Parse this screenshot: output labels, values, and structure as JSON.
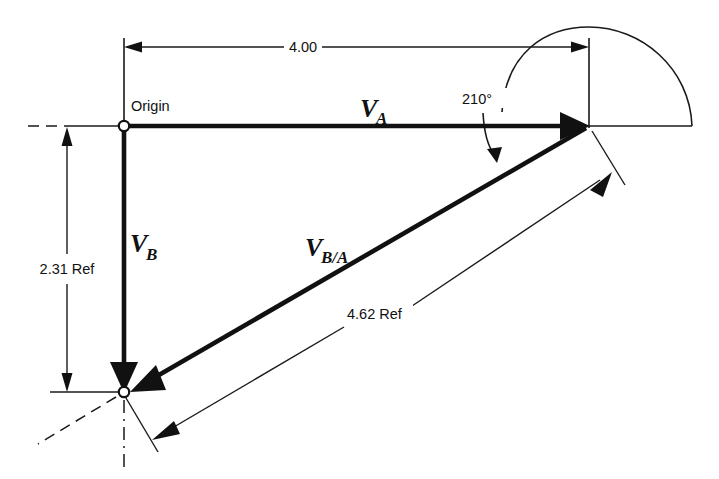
{
  "diagram": {
    "type": "engineering-vector-diagram",
    "background_color": "#ffffff",
    "line_color": "#111111",
    "labels": {
      "origin": "Origin",
      "dim_horizontal": "4.00",
      "dim_vertical": "2.31 Ref",
      "dim_diagonal": "4.62 Ref",
      "angle": "210°",
      "vector_a_main": "V",
      "vector_a_sub": "A",
      "vector_b_main": "V",
      "vector_b_sub": "B",
      "vector_ba_main": "V",
      "vector_ba_sub": "B/A"
    },
    "vectors": [
      {
        "name": "V_A",
        "label_main": "V",
        "label_sub": "A",
        "magnitude": "4.00",
        "from": "Origin",
        "direction": "horizontal-right"
      },
      {
        "name": "V_B",
        "label_main": "V",
        "label_sub": "B",
        "magnitude": "2.31 Ref",
        "from": "Origin",
        "direction": "vertical-down"
      },
      {
        "name": "V_B/A",
        "label_main": "V",
        "label_sub": "B/A",
        "magnitude": "4.62 Ref",
        "from": "tip of V_A",
        "direction": "down-left",
        "angle": "210°"
      }
    ],
    "dimensions": [
      {
        "name": "horizontal",
        "value": "4.00"
      },
      {
        "name": "vertical",
        "value": "2.31 Ref"
      },
      {
        "name": "diagonal",
        "value": "4.62 Ref"
      },
      {
        "name": "angle",
        "value": "210°"
      }
    ]
  }
}
